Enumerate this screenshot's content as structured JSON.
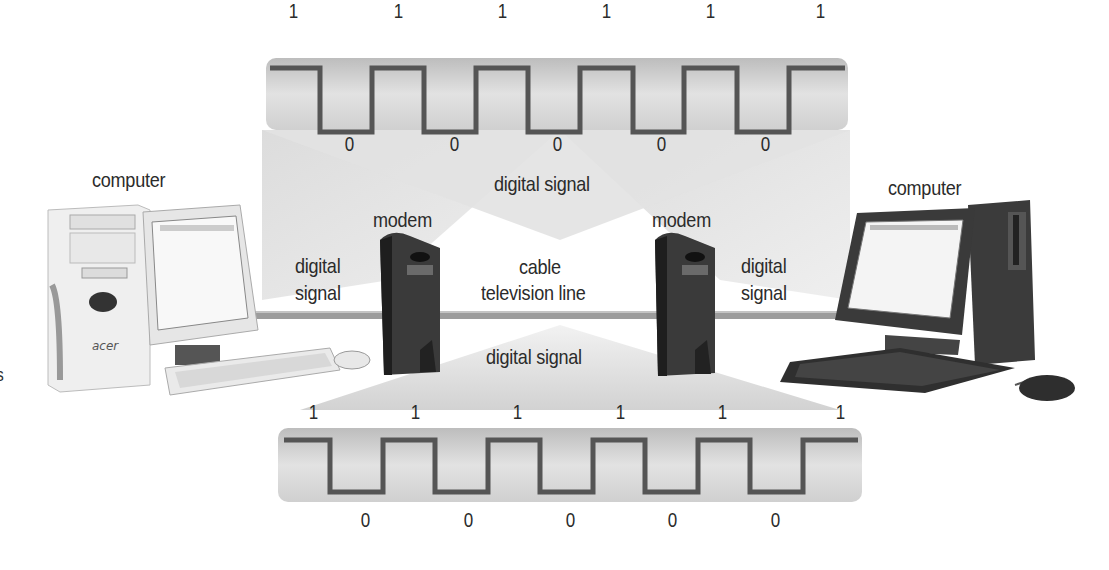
{
  "diagram": {
    "labels": {
      "left_computer": "computer",
      "right_computer": "computer",
      "left_modem": "modem",
      "right_modem": "modem",
      "top_signal": "digital signal",
      "bottom_signal": "digital signal",
      "left_signal_line1": "digital",
      "left_signal_line2": "signal",
      "right_signal_line1": "digital",
      "right_signal_line2": "signal",
      "cable_line1": "cable",
      "cable_line2": "television line",
      "left_computer_brand": "acer",
      "edge_fragment": "s"
    },
    "top_waveform": {
      "high_bits": [
        "1",
        "1",
        "1",
        "1",
        "1",
        "1"
      ],
      "low_bits": [
        "0",
        "0",
        "0",
        "0",
        "0"
      ]
    },
    "bottom_waveform": {
      "high_bits": [
        "1",
        "1",
        "1",
        "1",
        "1",
        "1"
      ],
      "low_bits": [
        "0",
        "0",
        "0",
        "0",
        "0"
      ]
    },
    "colors": {
      "wave_line": "#555555",
      "band": "#d8d8d8",
      "cone": "#e4e4e4",
      "cable": "#9a9a9a",
      "modem": "#3a3a3a"
    }
  }
}
